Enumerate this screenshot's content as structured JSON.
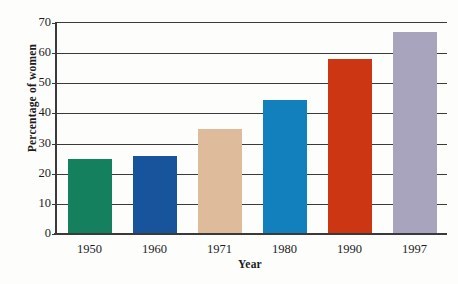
{
  "chart_data": {
    "type": "bar",
    "title": "",
    "xlabel": "Year",
    "ylabel": "Percentage of women",
    "categories": [
      "1950",
      "1960",
      "1971",
      "1980",
      "1990",
      "1997"
    ],
    "values": [
      25,
      26,
      35,
      44.5,
      58,
      67
    ],
    "series": [
      {
        "name": "Percentage of women",
        "values": [
          25,
          26,
          35,
          44.5,
          58,
          67
        ]
      }
    ],
    "bar_colors": [
      "#15805d",
      "#17549c",
      "#ddbb9b",
      "#1280bd",
      "#cc3613",
      "#a8a4bd"
    ],
    "ylim": [
      0,
      70
    ],
    "ytick_values": [
      0,
      10,
      20,
      30,
      40,
      50,
      60,
      70
    ],
    "ytick_labels": [
      "0",
      "10",
      "20",
      "30",
      "40",
      "50",
      "60",
      "70"
    ],
    "grid": "horizontal",
    "legend": "none",
    "axis_color": "#3a3a3a",
    "background": "#fdfdfc"
  }
}
